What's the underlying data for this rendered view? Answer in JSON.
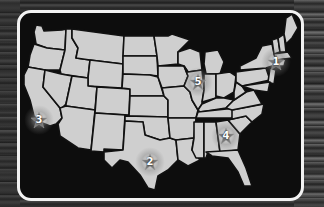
{
  "map": {
    "title": "United States map",
    "colors": {
      "land": "#cfcfcf",
      "borders": "#111111",
      "water": "#0d0d0d",
      "frame": "#f2f2f2"
    },
    "markers": [
      {
        "label": "1",
        "region": "New York / New Jersey",
        "x": 276,
        "y": 62
      },
      {
        "label": "2",
        "region": "Texas",
        "x": 150,
        "y": 162
      },
      {
        "label": "3",
        "region": "Southern California",
        "x": 39,
        "y": 120
      },
      {
        "label": "4",
        "region": "Georgia",
        "x": 226,
        "y": 136
      },
      {
        "label": "5",
        "region": "Illinois",
        "x": 198,
        "y": 82
      }
    ]
  }
}
